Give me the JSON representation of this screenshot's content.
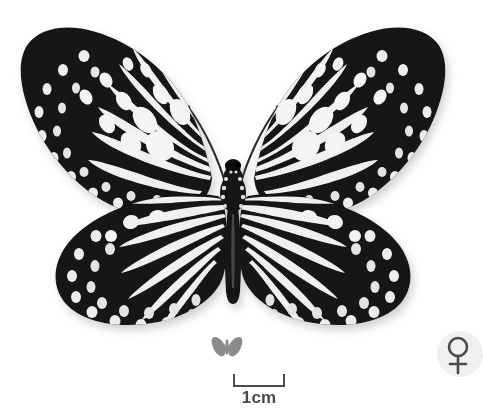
{
  "plate": {
    "background_color": "#ffffff",
    "subject": "butterfly-specimen-dorsal-view",
    "specimen_wing_color_dark": "#111111",
    "specimen_wing_color_light": "#f2f2f2"
  },
  "scale_bar": {
    "label": "1cm",
    "length_px": 52,
    "color": "#4d4d4d",
    "text_color": "#4a4a4a",
    "tick_style": "i-beam-downward"
  },
  "mini_icon": {
    "name": "butterfly-silhouette-icon",
    "color": "#8c8c8c"
  },
  "sex_badge": {
    "symbol": "♀",
    "meaning": "female",
    "color": "#4a4a4a",
    "background_color": "#f0f0f0"
  }
}
